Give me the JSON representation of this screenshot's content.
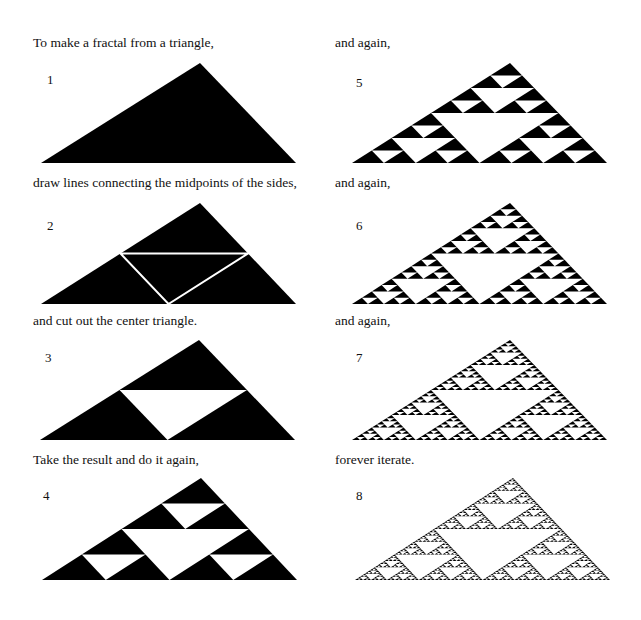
{
  "panels": [
    {
      "step": "1",
      "caption": "To make a fractal from a triangle,",
      "level": 0,
      "lines": false,
      "apex": [
        200,
        63
      ],
      "left": [
        41,
        163
      ],
      "right": [
        296,
        163
      ],
      "cap": [
        33,
        35
      ],
      "capw": 290,
      "num": [
        47,
        72
      ]
    },
    {
      "step": "2",
      "caption": "draw lines connecting the midpoints of the sides,",
      "level": 0,
      "lines": true,
      "apex": [
        200,
        203
      ],
      "left": [
        41,
        304
      ],
      "right": [
        296,
        304
      ],
      "cap": [
        33,
        175
      ],
      "capw": 285,
      "num": [
        47,
        218
      ]
    },
    {
      "step": "3",
      "caption": "and cut out the center triangle.",
      "level": 1,
      "lines": false,
      "apex": [
        199,
        340
      ],
      "left": [
        40,
        440
      ],
      "right": [
        295,
        440
      ],
      "cap": [
        33,
        313
      ],
      "capw": 290,
      "num": [
        45,
        350
      ]
    },
    {
      "step": "4",
      "caption": "Take the result and do it again,",
      "level": 2,
      "lines": false,
      "apex": [
        201,
        478
      ],
      "left": [
        42,
        580
      ],
      "right": [
        297,
        580
      ],
      "cap": [
        33,
        452
      ],
      "capw": 290,
      "num": [
        43,
        488
      ]
    },
    {
      "step": "5",
      "caption": "and again,",
      "level": 3,
      "lines": false,
      "apex": [
        510,
        63
      ],
      "left": [
        352,
        163
      ],
      "right": [
        607,
        163
      ],
      "cap": [
        335,
        35
      ],
      "capw": 290,
      "num": [
        356,
        75
      ]
    },
    {
      "step": "6",
      "caption": "and again,",
      "level": 4,
      "lines": false,
      "apex": [
        510,
        203
      ],
      "left": [
        352,
        304
      ],
      "right": [
        607,
        304
      ],
      "cap": [
        335,
        175
      ],
      "capw": 290,
      "num": [
        356,
        218
      ]
    },
    {
      "step": "7",
      "caption": "and again,",
      "level": 5,
      "lines": false,
      "apex": [
        510,
        340
      ],
      "left": [
        352,
        440
      ],
      "right": [
        607,
        440
      ],
      "cap": [
        335,
        313
      ],
      "capw": 290,
      "num": [
        356,
        350
      ]
    },
    {
      "step": "8",
      "caption": "forever iterate.",
      "level": 6,
      "lines": false,
      "apex": [
        513,
        478
      ],
      "left": [
        355,
        580
      ],
      "right": [
        610,
        580
      ],
      "cap": [
        335,
        452
      ],
      "capw": 290,
      "num": [
        356,
        488
      ]
    }
  ],
  "colors": {
    "fill": "#000000",
    "background": "#ffffff",
    "cut_line": "#ffffff"
  }
}
